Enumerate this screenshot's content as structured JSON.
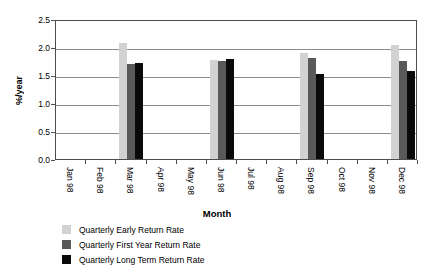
{
  "chart_data": {
    "type": "bar",
    "title": "",
    "xlabel": "Month",
    "ylabel": "%/year",
    "categories": [
      "Jan 98",
      "Feb 98",
      "Mar 98",
      "Apr 98",
      "May 98",
      "Jun 98",
      "Jul 98",
      "Aug 98",
      "Sep 98",
      "Oct 98",
      "Nov 98",
      "Dec 98"
    ],
    "ylim": [
      0.0,
      2.5
    ],
    "yticks": [
      "0.0",
      "0.5",
      "1.0",
      "1.5",
      "2.0",
      "2.5"
    ],
    "ytick_values": [
      0.0,
      0.5,
      1.0,
      1.5,
      2.0,
      2.5
    ],
    "grid": true,
    "legend_position": "below",
    "series": [
      {
        "name": "Quarterly Early Return Rate",
        "color": "#d2d2d2",
        "values": [
          null,
          null,
          2.08,
          null,
          null,
          1.77,
          null,
          null,
          1.9,
          null,
          null,
          2.03
        ]
      },
      {
        "name": "Quarterly First Year Return Rate",
        "color": "#595959",
        "values": [
          null,
          null,
          1.69,
          null,
          null,
          1.75,
          null,
          null,
          1.8,
          null,
          null,
          1.75
        ]
      },
      {
        "name": "Quarterly Long Term Return Rate",
        "color": "#0a0a0a",
        "values": [
          null,
          null,
          1.72,
          null,
          null,
          1.78,
          null,
          null,
          1.52,
          null,
          null,
          1.58
        ]
      }
    ]
  }
}
